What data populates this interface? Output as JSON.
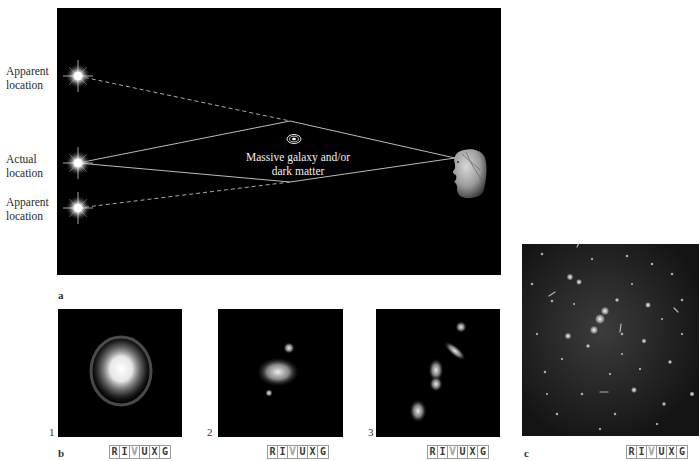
{
  "figure": {
    "panel_a": {
      "letter": "a",
      "labels": {
        "apparent_top": [
          "Apparent",
          "location"
        ],
        "actual": [
          "Actual",
          "location"
        ],
        "apparent_bottom": [
          "Apparent",
          "location"
        ]
      },
      "lens_caption": [
        "Massive galaxy and/or",
        "dark matter"
      ],
      "elements": {
        "stars": [
          "apparent-top-star",
          "actual-star",
          "apparent-bottom-star"
        ],
        "lens": "galaxy-icon",
        "observer": "observer-head-icon"
      },
      "rays": {
        "solid": "light path from actual location bent by lens to observer",
        "dashed": "apparent straight-line path to apparent locations"
      }
    },
    "panel_b": {
      "letter": "b",
      "images": [
        {
          "number": "1",
          "rivuxg": [
            "R",
            "I",
            "V",
            "U",
            "X",
            "G"
          ],
          "active": "V"
        },
        {
          "number": "2",
          "rivuxg": [
            "R",
            "I",
            "V",
            "U",
            "X",
            "G"
          ],
          "active": "V"
        },
        {
          "number": "3",
          "rivuxg": [
            "R",
            "I",
            "V",
            "U",
            "X",
            "G"
          ],
          "active": "V"
        }
      ]
    },
    "panel_c": {
      "letter": "c",
      "rivuxg": [
        "R",
        "I",
        "V",
        "U",
        "X",
        "G"
      ],
      "active": "V"
    }
  },
  "colors": {
    "panel_bg": "#000000",
    "page_bg": "#ffffff",
    "ray": "#cfcfcf",
    "label_text": "#2a2a2a"
  }
}
